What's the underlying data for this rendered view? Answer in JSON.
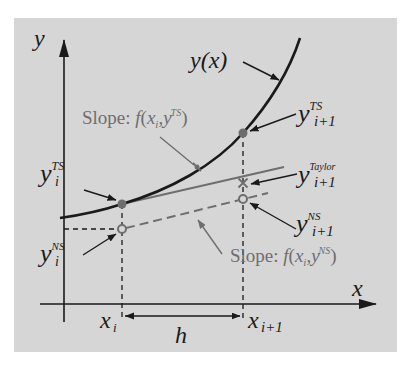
{
  "figure": {
    "background_color": "#d6d6d6",
    "curve_color": "#1a1a1a",
    "secondary_color": "#6e6e6e",
    "axes": {
      "y_label": "y",
      "x_label": "x"
    },
    "curve": {
      "label": "y(x)"
    },
    "points": {
      "y_i_TS": {
        "base": "y",
        "sub": "i",
        "sup": "TS"
      },
      "y_i_NS": {
        "base": "y",
        "sub": "i",
        "sup": "NS"
      },
      "y_ip1_TS": {
        "base": "y",
        "sub": "i+1",
        "sup": "TS"
      },
      "y_ip1_Taylor": {
        "base": "y",
        "sub": "i+1",
        "sup": "Taylor"
      },
      "y_ip1_NS": {
        "base": "y",
        "sub": "i+1",
        "sup": "NS"
      }
    },
    "ticks": {
      "x_i": {
        "base": "x",
        "sub": "i"
      },
      "x_ip1": {
        "base": "x",
        "sub": "i+1"
      }
    },
    "step": {
      "label": "h"
    },
    "slopes": {
      "ts": {
        "prefix": "Slope: ",
        "func": "f",
        "open": "(",
        "x": "x",
        "x_sub": "i",
        "comma": ",",
        "y": "y",
        "y_sub": "i",
        "y_sup": "TS",
        "close": ")"
      },
      "ns": {
        "prefix": "Slope: ",
        "func": "f",
        "open": "(",
        "x": "x",
        "x_sub": "i",
        "comma": ",",
        "y": "y",
        "y_sub": "i",
        "y_sup": "NS",
        "close": ")"
      }
    }
  }
}
